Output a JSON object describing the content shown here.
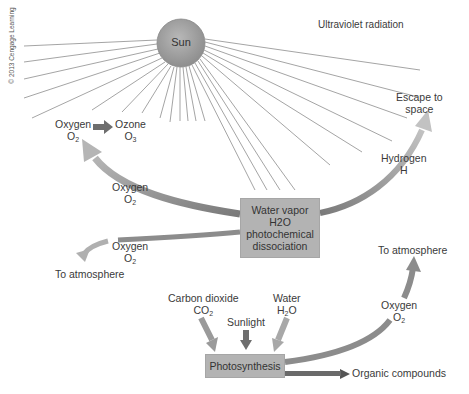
{
  "copyright": "© 2013 Cengage Learning",
  "sun": {
    "label": "Sun"
  },
  "radiation": {
    "label": "Ultraviolet radiation"
  },
  "escape": {
    "line1": "Escape to",
    "line2": "space"
  },
  "hydrogen": {
    "name": "Hydrogen",
    "formula": "H"
  },
  "oxygen_top": {
    "name": "Oxygen",
    "formula_main": "O",
    "formula_sub": "2"
  },
  "ozone": {
    "name": "Ozone",
    "formula_main": "O",
    "formula_sub": "3"
  },
  "oxygen_mid": {
    "name": "Oxygen",
    "formula_main": "O",
    "formula_sub": "2"
  },
  "water_box": {
    "line1": "Water vapor",
    "formula_main": "H",
    "formula_sub": "2",
    "formula_tail": "O",
    "line3": "photochemical",
    "line4": "dissociation"
  },
  "oxygen_left": {
    "name": "Oxygen",
    "formula_main": "O",
    "formula_sub": "2"
  },
  "to_atmosphere_left": "To atmosphere",
  "to_atmosphere_right": "To atmosphere",
  "oxygen_right": {
    "name": "Oxygen",
    "formula_main": "O",
    "formula_sub": "2"
  },
  "carbon_dioxide": {
    "name": "Carbon dioxide",
    "formula_main": "CO",
    "formula_sub": "2"
  },
  "sunlight": "Sunlight",
  "water": {
    "name": "Water",
    "formula_main": "H",
    "formula_sub": "2",
    "formula_tail": "O"
  },
  "photosynthesis": "Photosynthesis",
  "organic_compounds": "Organic compounds",
  "colors": {
    "sun": "#a0a0a0",
    "box": "#b3b3b3",
    "arrow": "#8c8c8c",
    "ray": "#9a9a9a"
  }
}
